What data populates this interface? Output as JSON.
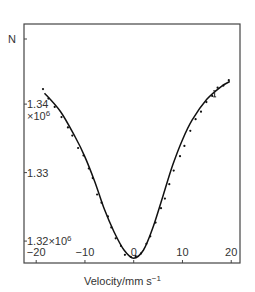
{
  "chart_data": {
    "type": "line",
    "title": "",
    "xlabel": "Velocity/mm s",
    "xlabel_superscript": "−1",
    "ylabel": "N",
    "xlim": [
      -22.5,
      21.8
    ],
    "ylim": [
      1.3168,
      1.3517
    ],
    "x_ticks": [
      -20,
      -10,
      0,
      10,
      20
    ],
    "x_tick_labels": [
      "−20",
      "−10",
      "0",
      "10",
      "20"
    ],
    "y_ticks": [
      1.34,
      1.33,
      1.32
    ],
    "y_tick_labels": [
      {
        "main": "1.34",
        "sub": "×10",
        "sup": "6"
      },
      {
        "main": "1.33",
        "sub": "",
        "sup": ""
      },
      {
        "main": "1.32×10",
        "sub": "",
        "sup": "6"
      }
    ],
    "y_scale_note": "×10^6",
    "grid": false,
    "legend": null,
    "series": [
      {
        "name": "fit",
        "style": "line",
        "color": "#111111",
        "x": [
          -18.3,
          -15,
          -12,
          -10,
          -8,
          -6,
          -4,
          -2,
          0,
          2,
          4,
          6,
          8,
          10,
          12,
          15,
          18,
          19.7
        ],
        "y": [
          1.3416,
          1.3389,
          1.3352,
          1.3323,
          1.3287,
          1.3246,
          1.3213,
          1.3187,
          1.3175,
          1.3187,
          1.3221,
          1.3266,
          1.3311,
          1.3348,
          1.3377,
          1.3407,
          1.3426,
          1.3433
        ]
      },
      {
        "name": "data",
        "style": "points",
        "color": "#111111",
        "x": [
          -18.6,
          -17.5,
          -16.2,
          -14.8,
          -13.5,
          -12.6,
          -11.4,
          -10.3,
          -9.2,
          -8.4,
          -7.5,
          -6.6,
          -5.3,
          -4.6,
          -3.7,
          -2.6,
          -1.8,
          -0.6,
          0.4,
          1.5,
          2.6,
          3.4,
          4.5,
          5.6,
          6.4,
          7.3,
          8.2,
          9.5,
          10.4,
          11.6,
          12.7,
          13.8,
          14.9,
          16.1,
          17.2,
          18.4,
          19.5
        ],
        "y": [
          1.3422,
          1.3408,
          1.3396,
          1.3381,
          1.3366,
          1.3354,
          1.3336,
          1.3325,
          1.3306,
          1.3292,
          1.3268,
          1.3256,
          1.3236,
          1.322,
          1.3204,
          1.3193,
          1.318,
          1.3177,
          1.3178,
          1.3182,
          1.3196,
          1.3207,
          1.3227,
          1.3248,
          1.3262,
          1.3283,
          1.3303,
          1.3324,
          1.3339,
          1.3361,
          1.3378,
          1.3389,
          1.3403,
          1.3412,
          1.3424,
          1.3427,
          1.3435
        ]
      }
    ],
    "annotations": [
      {
        "text": "I",
        "meaning": "error-bar",
        "x": 16.6,
        "y": 1.3415
      }
    ]
  }
}
